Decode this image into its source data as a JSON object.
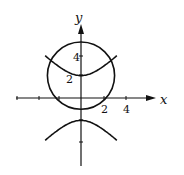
{
  "chart_data": {
    "type": "line",
    "title": "",
    "xlabel": "x",
    "ylabel": "y",
    "x_ticks": [
      "2",
      "4"
    ],
    "y_ticks": [
      "2",
      "4"
    ],
    "xlim": [
      -6,
      6.5
    ],
    "ylim": [
      -7,
      8.5
    ],
    "grid": false,
    "legend": null,
    "series": [
      {
        "name": "circle",
        "equation": "x^2 + (y-2)^2 = 9",
        "center": [
          0,
          2
        ],
        "radius": 3
      },
      {
        "name": "hyperbola",
        "equation": "y^2 - x^2 = 4",
        "vertices": [
          [
            0,
            2
          ],
          [
            0,
            -2
          ]
        ]
      }
    ]
  },
  "labels": {
    "x_axis": "x",
    "y_axis": "y",
    "tick_x2": "2",
    "tick_x4": "4",
    "tick_y2": "2",
    "tick_y4": "4"
  },
  "colors": {
    "ink": "#111111",
    "background": "#ffffff"
  }
}
